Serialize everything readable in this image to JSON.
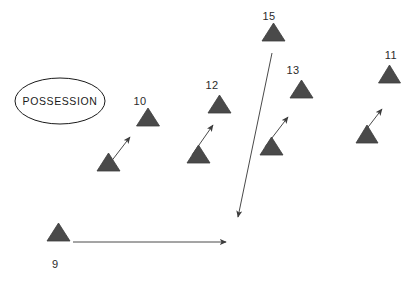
{
  "diagram": {
    "title_shape": {
      "label": "POSSESSION",
      "shape": "ellipse",
      "cx": 60,
      "cy": 101,
      "rx": 45,
      "ry": 23,
      "stroke": "#1a1a1a",
      "fill": "#ffffff"
    },
    "colors": {
      "triangle_fill": "#4a4a4a",
      "triangle_stroke": "#3c3c3c",
      "line": "#4a4a4a",
      "text": "#2b2b2b",
      "background": "#ffffff"
    },
    "players": [
      {
        "number": "9",
        "label_x": 52,
        "label_y": 268,
        "marker": {
          "cx": 58.5,
          "cy": 241,
          "half_width": 11.5,
          "height": 18
        },
        "movement": {
          "type": "straight-long",
          "x1": 73,
          "y1": 242,
          "x2": 226,
          "y2": 242
        }
      },
      {
        "number": "10",
        "label_x": 140,
        "label_y": 105,
        "marker": {
          "cx": 108.5,
          "cy": 171,
          "half_width": 11.5,
          "height": 18
        },
        "target": {
          "cx": 148,
          "cy": 126,
          "half_width": 11.5,
          "height": 18
        },
        "movement": {
          "type": "short-run",
          "x1": 110,
          "y1": 163,
          "x2": 130,
          "y2": 137
        }
      },
      {
        "number": "12",
        "label_x": 212,
        "label_y": 89,
        "marker": {
          "cx": 198.5,
          "cy": 163,
          "half_width": 11.5,
          "height": 18
        },
        "target": {
          "cx": 219.5,
          "cy": 113,
          "half_width": 11.5,
          "height": 18
        },
        "movement": {
          "type": "short-run",
          "x1": 192,
          "y1": 155,
          "x2": 213,
          "y2": 125
        }
      },
      {
        "number": "13",
        "label_x": 293,
        "label_y": 74,
        "marker": {
          "cx": 271.5,
          "cy": 155,
          "half_width": 11.5,
          "height": 18
        },
        "target": {
          "cx": 301.5,
          "cy": 98,
          "half_width": 11.5,
          "height": 18
        },
        "movement": {
          "type": "short-run",
          "x1": 265,
          "y1": 147,
          "x2": 288,
          "y2": 117
        }
      },
      {
        "number": "15",
        "label_x": 263,
        "label_y": 20,
        "marker": {
          "cx": 273.5,
          "cy": 41,
          "half_width": 11.5,
          "height": 18
        },
        "movement": {
          "type": "straight-long",
          "x1": 272,
          "y1": 53,
          "x2": 238,
          "y2": 217
        }
      },
      {
        "number": "11",
        "label_x": 389,
        "label_y": 59,
        "marker": {
          "cx": 367,
          "cy": 143,
          "half_width": 11,
          "height": 18
        },
        "target": {
          "cx": 389.5,
          "cy": 83,
          "half_width": 11,
          "height": 18
        },
        "movement": {
          "type": "short-run",
          "x1": 362,
          "y1": 135,
          "x2": 382,
          "y2": 109
        }
      }
    ]
  }
}
